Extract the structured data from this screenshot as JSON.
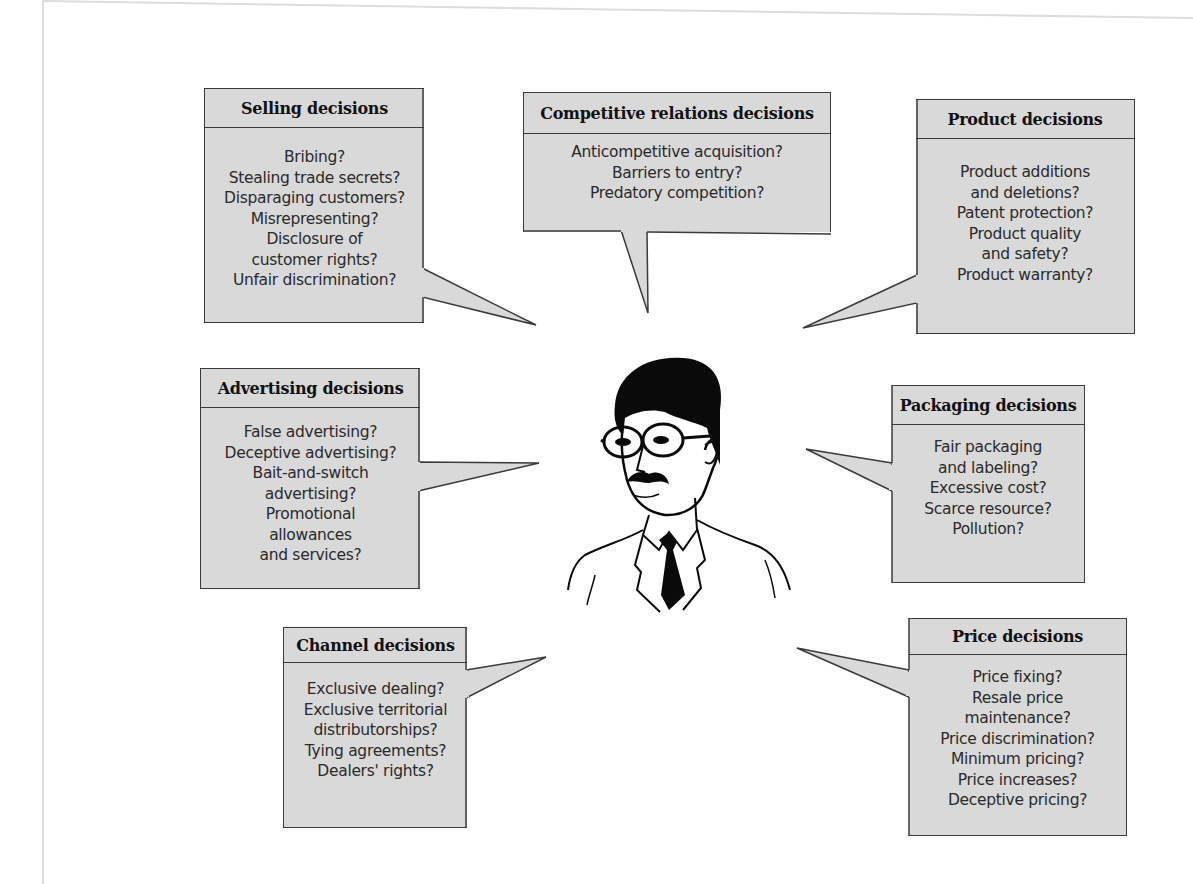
{
  "diagram": {
    "center_figure": "marketing-manager-illustration",
    "boxes": [
      {
        "id": "selling",
        "title": "Selling decisions",
        "items": [
          "Bribing?",
          "Stealing trade secrets?",
          "Disparaging customers?",
          "Misrepresenting?",
          "Disclosure of",
          "customer rights?",
          "Unfair discrimination?"
        ]
      },
      {
        "id": "competitive",
        "title": "Competitive relations decisions",
        "items": [
          "Anticompetitive acquisition?",
          "Barriers to entry?",
          "Predatory competition?"
        ]
      },
      {
        "id": "product",
        "title": "Product decisions",
        "items": [
          "Product additions",
          "and deletions?",
          "Patent protection?",
          "Product quality",
          "and safety?",
          "Product warranty?"
        ]
      },
      {
        "id": "advertising",
        "title": "Advertising decisions",
        "items": [
          "False advertising?",
          "Deceptive advertising?",
          "Bait-and-switch",
          "advertising?",
          "Promotional",
          "allowances",
          "and services?"
        ]
      },
      {
        "id": "packaging",
        "title": "Packaging decisions",
        "items": [
          "Fair packaging",
          "and labeling?",
          "Excessive cost?",
          "Scarce resource?",
          "Pollution?"
        ]
      },
      {
        "id": "channel",
        "title": "Channel decisions",
        "items": [
          "Exclusive dealing?",
          "Exclusive territorial",
          "distributorships?",
          "Tying agreements?",
          "Dealers' rights?"
        ]
      },
      {
        "id": "price",
        "title": "Price decisions",
        "items": [
          "Price fixing?",
          "Resale price",
          "maintenance?",
          "Price discrimination?",
          "Minimum pricing?",
          "Price increases?",
          "Deceptive pricing?"
        ]
      }
    ]
  },
  "colors": {
    "box_fill": "#d9d9d9",
    "box_border": "#3a3a3a",
    "figure_ink": "#0a0a0a",
    "background": "#ffffff"
  }
}
